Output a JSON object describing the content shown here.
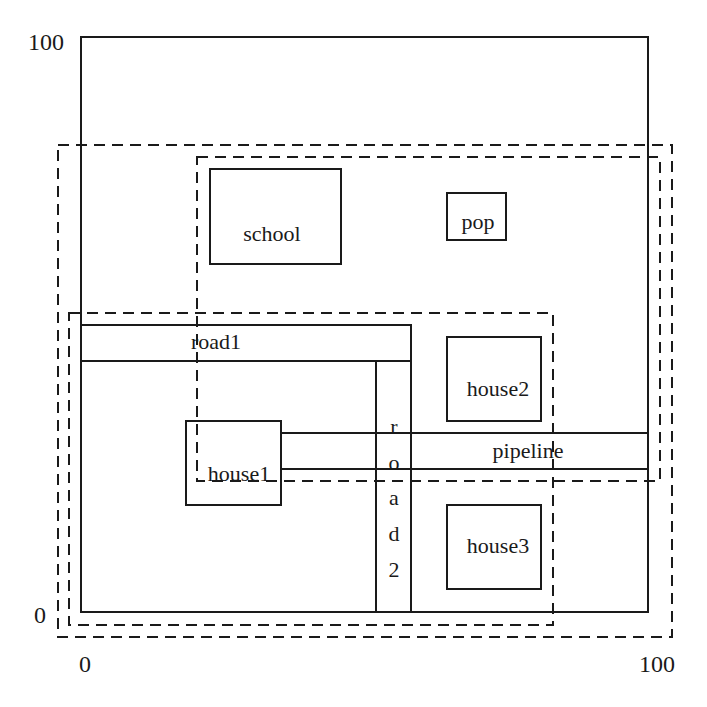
{
  "diagram": {
    "axes": {
      "y_max_label": "100",
      "y_min_label": "0",
      "x_min_label": "0",
      "x_max_label": "100"
    },
    "frame": {
      "x": 81,
      "y": 37,
      "w": 567,
      "h": 575
    },
    "dashed_regions": [
      {
        "id": "outer",
        "x": 58,
        "y": 145,
        "w": 614,
        "h": 492
      },
      {
        "id": "upper-right",
        "x": 197,
        "y": 157,
        "w": 463,
        "h": 324
      },
      {
        "id": "lower-left",
        "x": 69,
        "y": 313,
        "w": 484,
        "h": 312
      }
    ],
    "objects": [
      {
        "id": "school",
        "label": "school",
        "x": 210,
        "y": 169,
        "w": 131,
        "h": 95,
        "lx": 272,
        "ly": 241
      },
      {
        "id": "pop",
        "label": "pop",
        "x": 447,
        "y": 193,
        "w": 59,
        "h": 47,
        "lx": 478,
        "ly": 229
      },
      {
        "id": "road1",
        "label": "road1",
        "x": 81,
        "y": 325,
        "w": 330,
        "h": 36,
        "lx": 216,
        "ly": 349
      },
      {
        "id": "road2",
        "label": "road2",
        "x": 376,
        "y": 361,
        "w": 35,
        "h": 251
      },
      {
        "id": "house1",
        "label": "house1",
        "x": 186,
        "y": 421,
        "w": 95,
        "h": 84,
        "lx": 239,
        "ly": 481
      },
      {
        "id": "pipeline",
        "label": "pipeline",
        "x": 281,
        "y": 433,
        "w": 367,
        "h": 36,
        "lx": 528,
        "ly": 458
      },
      {
        "id": "house2",
        "label": "house2",
        "x": 447,
        "y": 337,
        "w": 94,
        "h": 84,
        "lx": 498,
        "ly": 396
      },
      {
        "id": "house3",
        "label": "house3",
        "x": 447,
        "y": 505,
        "w": 94,
        "h": 84,
        "lx": 498,
        "ly": 553
      }
    ],
    "road2_letters": [
      "r",
      "o",
      "a",
      "d",
      "2"
    ]
  }
}
